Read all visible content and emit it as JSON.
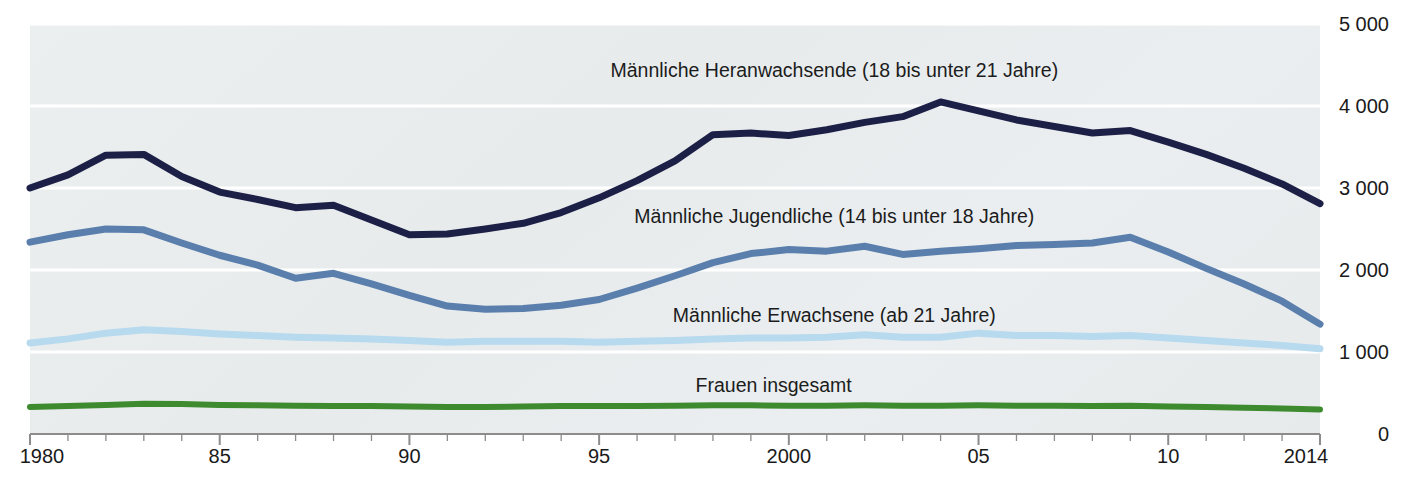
{
  "chart_data": {
    "type": "line",
    "title": "",
    "subtitle": "",
    "xlabel": "",
    "ylabel": "",
    "xlim": [
      1980,
      2014
    ],
    "ylim": [
      0,
      5000
    ],
    "grid": true,
    "legend_position": "inline-annotations",
    "x": [
      1980,
      1981,
      1982,
      1983,
      1984,
      1985,
      1986,
      1987,
      1988,
      1989,
      1990,
      1991,
      1992,
      1993,
      1994,
      1995,
      1996,
      1997,
      1998,
      1999,
      2000,
      2001,
      2002,
      2003,
      2004,
      2005,
      2006,
      2007,
      2008,
      2009,
      2010,
      2011,
      2012,
      2013,
      2014
    ],
    "x_tick_labels": [
      "1980",
      "85",
      "90",
      "95",
      "2000",
      "05",
      "10",
      "2014"
    ],
    "x_tick_values": [
      1980,
      1985,
      1990,
      1995,
      2000,
      2005,
      2010,
      2014
    ],
    "y_tick_labels": [
      "5 000",
      "4 000",
      "3 000",
      "2 000",
      "1 000",
      "0"
    ],
    "y_tick_values": [
      5000,
      4000,
      3000,
      2000,
      1000,
      0
    ],
    "series": [
      {
        "name": "Männliche Heranwachsende (18 bis unter 21 Jahre)",
        "color": "#1d2046",
        "label_x": 2001.2,
        "label_y": 4430,
        "values": [
          3000,
          3160,
          3400,
          3410,
          3140,
          2950,
          2860,
          2760,
          2790,
          2610,
          2430,
          2440,
          2500,
          2570,
          2700,
          2880,
          3090,
          3330,
          3650,
          3670,
          3640,
          3710,
          3800,
          3870,
          4050,
          3940,
          3830,
          3750,
          3670,
          3700,
          3560,
          3410,
          3240,
          3050,
          2810
        ]
      },
      {
        "name": "Männliche Jugendliche (14 bis unter 18 Jahre)",
        "color": "#5b7fad",
        "label_x": 2001.2,
        "label_y": 2650,
        "values": [
          2340,
          2430,
          2500,
          2490,
          2330,
          2180,
          2060,
          1900,
          1960,
          1830,
          1690,
          1560,
          1520,
          1530,
          1570,
          1640,
          1780,
          1930,
          2090,
          2200,
          2250,
          2230,
          2290,
          2190,
          2230,
          2260,
          2300,
          2310,
          2330,
          2400,
          2220,
          2020,
          1830,
          1620,
          1340
        ]
      },
      {
        "name": "Männliche Erwachsene (ab 21 Jahre)",
        "color": "#b7daee",
        "label_x": 2001.2,
        "label_y": 1440,
        "values": [
          1110,
          1160,
          1230,
          1270,
          1250,
          1220,
          1200,
          1180,
          1170,
          1160,
          1140,
          1120,
          1130,
          1130,
          1130,
          1120,
          1130,
          1140,
          1160,
          1170,
          1170,
          1180,
          1210,
          1180,
          1180,
          1230,
          1200,
          1200,
          1190,
          1200,
          1170,
          1140,
          1110,
          1080,
          1040
        ]
      },
      {
        "name": "Frauen insgesamt",
        "color": "#3d8b2e",
        "label_x": 1999.6,
        "label_y": 580,
        "values": [
          330,
          340,
          355,
          370,
          365,
          355,
          350,
          345,
          340,
          340,
          335,
          330,
          330,
          335,
          340,
          340,
          340,
          345,
          350,
          350,
          345,
          345,
          350,
          345,
          345,
          350,
          345,
          345,
          340,
          345,
          335,
          330,
          320,
          310,
          300
        ]
      }
    ]
  }
}
